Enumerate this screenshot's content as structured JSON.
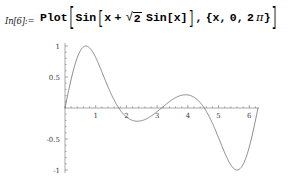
{
  "notebook": {
    "input_cell": {
      "label": "In[6]:=",
      "expression_text": "Plot[Sin[x + Sqrt[2] Sin[x]], {x, 0, 2 Pi}]",
      "tokens": {
        "head": "Plot",
        "open_bracket_1": "[",
        "sin_outer": "Sin",
        "open_bracket_2": "[",
        "var_x": "x",
        "plus": "+",
        "radical_sign": "√",
        "radicand": "2",
        "sin_inner": "Sin",
        "open_bracket_3": "[",
        "var_x2": "x",
        "close_bracket_3": "]",
        "close_bracket_2": "]",
        "comma_1": ",",
        "open_brace": "{",
        "iter_var": "x",
        "comma_2": ",",
        "iter_min": "0",
        "comma_3": ",",
        "iter_max_coeff": "2",
        "iter_max_pi": "π",
        "close_brace": "}",
        "close_bracket_1": "]"
      }
    }
  },
  "chart_data": {
    "type": "line",
    "title": "",
    "subtitle": "",
    "xlabel": "",
    "ylabel": "",
    "expression": "Sin[x + Sqrt[2] Sin[x]]",
    "domain": [
      0,
      6.283185307179586
    ],
    "xlim": [
      0,
      6.283185307179586
    ],
    "ylim": [
      -1.05,
      1.05
    ],
    "grid": false,
    "legend": false,
    "legend_position": "none",
    "axes_style": "mathematica-crossed-axes",
    "x_ticks": [
      1,
      2,
      3,
      4,
      5,
      6
    ],
    "x_tick_labels": [
      "1",
      "2",
      "3",
      "4",
      "5",
      "6"
    ],
    "y_ticks": [
      -1,
      -0.5,
      0.5,
      1
    ],
    "y_tick_labels": [
      "-1",
      "-0.5",
      "0.5",
      "1"
    ],
    "curve_color": "#5a5a5a",
    "axis_color": "#6e6e6e",
    "series": [
      {
        "name": "Sin[x + Sqrt[2] Sin[x]]",
        "x": [
          0.0,
          0.126,
          0.251,
          0.377,
          0.503,
          0.628,
          0.754,
          0.88,
          1.005,
          1.131,
          1.257,
          1.382,
          1.508,
          1.634,
          1.759,
          1.885,
          2.011,
          2.136,
          2.262,
          2.388,
          2.513,
          2.639,
          2.765,
          2.89,
          3.016,
          3.142,
          3.267,
          3.393,
          3.519,
          3.644,
          3.77,
          3.896,
          4.021,
          4.147,
          4.273,
          4.398,
          4.524,
          4.65,
          4.775,
          4.901,
          5.027,
          5.152,
          5.278,
          5.404,
          5.529,
          5.655,
          5.781,
          5.906,
          6.032,
          6.158,
          6.283
        ],
        "y": [
          0.0,
          0.295,
          0.556,
          0.761,
          0.901,
          0.977,
          0.999,
          0.977,
          0.918,
          0.824,
          0.692,
          0.517,
          0.297,
          0.045,
          -0.211,
          -0.433,
          -0.586,
          -0.658,
          -0.655,
          -0.591,
          -0.483,
          -0.346,
          -0.194,
          -0.038,
          0.113,
          0.25,
          0.364,
          0.444,
          0.483,
          0.476,
          0.425,
          0.334,
          0.213,
          0.074,
          -0.071,
          -0.216,
          -0.361,
          -0.508,
          -0.651,
          -0.78,
          -0.884,
          -0.955,
          -0.993,
          -0.999,
          -0.972,
          -0.902,
          -0.777,
          -0.59,
          -0.354,
          -0.11,
          0.0
        ]
      }
    ],
    "annotations": {
      "global_max": {
        "x": 0.75,
        "y": 1.0
      },
      "local_min_1": {
        "x": 2.2,
        "y": -0.66
      },
      "local_max_2": {
        "x": 3.55,
        "y": 0.48
      },
      "global_min": {
        "x": 5.45,
        "y": -1.0
      }
    }
  }
}
